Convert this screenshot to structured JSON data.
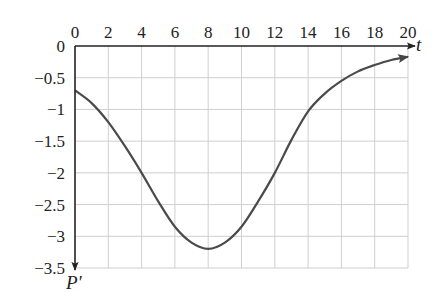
{
  "chart_data": {
    "type": "line",
    "title": "",
    "xlabel": "t",
    "ylabel": "P'",
    "xlim": [
      0,
      20
    ],
    "ylim": [
      -3.5,
      0
    ],
    "grid": true,
    "legend": null,
    "x_ticks": [
      "0",
      "2",
      "4",
      "6",
      "8",
      "10",
      "12",
      "14",
      "16",
      "18",
      "20"
    ],
    "y_ticks": [
      "0",
      "-0.5",
      "-1",
      "-1.5",
      "-2",
      "-2.5",
      "-3",
      "-3.5"
    ],
    "x_tick_values": [
      0,
      2,
      4,
      6,
      8,
      10,
      12,
      14,
      16,
      18,
      20
    ],
    "y_tick_values": [
      0,
      -0.5,
      -1,
      -1.5,
      -2,
      -2.5,
      -3,
      -3.5
    ],
    "series": [
      {
        "name": "P'(t)",
        "x": [
          0,
          1,
          2,
          3,
          4,
          5,
          6,
          7,
          8,
          9,
          10,
          11,
          12,
          13,
          14,
          15,
          16,
          17,
          18,
          19,
          20
        ],
        "y": [
          -0.7,
          -0.9,
          -1.2,
          -1.58,
          -2.0,
          -2.45,
          -2.85,
          -3.1,
          -3.2,
          -3.1,
          -2.85,
          -2.45,
          -2.0,
          -1.48,
          -1.03,
          -0.75,
          -0.55,
          -0.4,
          -0.3,
          -0.22,
          -0.17
        ]
      }
    ],
    "annotations": [
      "curve ends with arrowhead at t=20"
    ]
  }
}
